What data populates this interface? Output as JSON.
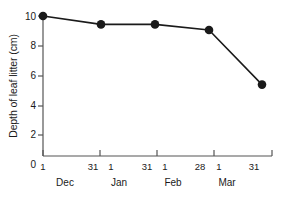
{
  "chart_data": {
    "type": "line",
    "title": "",
    "subtitle": "",
    "xlabel": "",
    "ylabel": "Depth of leaf litter (cm)",
    "ylim": [
      0,
      10
    ],
    "y_ticks": [
      0,
      2,
      4,
      6,
      8,
      10
    ],
    "y_tick_labels": [
      "0",
      "2",
      "4",
      "6",
      "8",
      "10"
    ],
    "grid": false,
    "legend": false,
    "legend_position": "none",
    "marker": "filled-circle",
    "line_color": "#1a1a1a",
    "marker_color": "#1a1a1a",
    "axis_color": "#555555",
    "background_color": "#ffffff",
    "x_categories": [
      "Dec 1",
      "Dec 31",
      "Jan 31",
      "Feb 28",
      "Mar 31"
    ],
    "values": [
      10.0,
      9.4,
      9.4,
      9.0,
      5.1
    ],
    "points": [
      {
        "x_label": "Dec 1",
        "y": 10.0
      },
      {
        "x_label": "Dec 31",
        "y": 9.4
      },
      {
        "x_label": "Jan 31",
        "y": 9.4
      },
      {
        "x_label": "Feb 28",
        "y": 9.0
      },
      {
        "x_label": "Mar 31",
        "y": 5.1
      }
    ],
    "x_months": [
      {
        "name": "Dec",
        "start_day": "1",
        "end_day": "31"
      },
      {
        "name": "Jan",
        "start_day": "1",
        "end_day": "31"
      },
      {
        "name": "Feb",
        "start_day": "1",
        "end_day": "28"
      },
      {
        "name": "Mar",
        "start_day": "1",
        "end_day": "31"
      }
    ],
    "x_day_labels": [
      "1",
      "31",
      "1",
      "31",
      "1",
      "28",
      "1",
      "31"
    ],
    "month_labels": [
      "Dec",
      "Jan",
      "Feb",
      "Mar"
    ]
  }
}
